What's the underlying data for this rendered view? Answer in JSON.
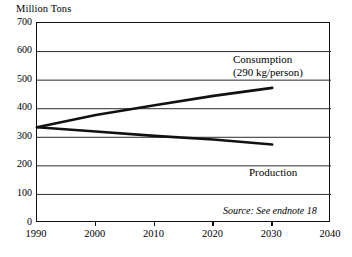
{
  "chart_data": {
    "type": "line",
    "title": "",
    "ylabel": "Million Tons",
    "xlabel": "",
    "ylim": [
      0,
      700
    ],
    "xlim": [
      1990,
      2040
    ],
    "yticks": [
      0,
      100,
      200,
      300,
      400,
      500,
      600,
      700
    ],
    "ytick_labels": [
      "0",
      "100",
      "200",
      "300",
      "400",
      "500",
      "600",
      "700"
    ],
    "xticks": [
      1990,
      2000,
      2010,
      2020,
      2030,
      2040
    ],
    "xtick_labels": [
      "1990",
      "2000",
      "2010",
      "2020",
      "2030",
      "2040"
    ],
    "grid": "horizontal",
    "legend": "inline-annotations",
    "x": [
      1990,
      2000,
      2010,
      2020,
      2030
    ],
    "series": [
      {
        "name": "Consumption",
        "values": [
          335,
          378,
          412,
          445,
          473
        ]
      },
      {
        "name": "Production",
        "values": [
          335,
          320,
          305,
          292,
          275
        ]
      }
    ],
    "annotations": [
      {
        "name": "consumption-label",
        "line1": "Consumption",
        "line2": "(290 kg/person)"
      },
      {
        "name": "production-label",
        "line1": "Production"
      },
      {
        "name": "source-note",
        "text": "Source: See endnote 18"
      }
    ],
    "colors": {
      "line": "#111111",
      "grid": "#2b2b2b",
      "frame": "#111111",
      "background": "#ffffff",
      "text": "#000000"
    }
  },
  "labels": {
    "axis_title": "Million Tons",
    "consumption_line1": "Consumption",
    "consumption_line2": "(290 kg/person)",
    "production": "Production",
    "source": "Source: See endnote 18",
    "y0": "0",
    "y100": "100",
    "y200": "200",
    "y300": "300",
    "y400": "400",
    "y500": "500",
    "y600": "600",
    "y700": "700",
    "x1990": "1990",
    "x2000": "2000",
    "x2010": "2010",
    "x2020": "2020",
    "x2030": "2030",
    "x2040": "2040"
  }
}
